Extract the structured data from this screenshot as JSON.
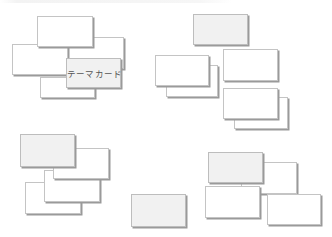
{
  "diagram": {
    "title": "",
    "colors": {
      "card_fill": "#ffffff",
      "card_fill_highlight": "#f1f1f1",
      "card_border": "#c4c4c4",
      "card_shadow": "#9a9a9a",
      "label_text": "#555555"
    },
    "clusters": [
      {
        "name": "top-left",
        "cards": [
          {
            "x": 40,
            "y": 77,
            "w": 55,
            "h": 21,
            "fill": "white",
            "label": ""
          },
          {
            "x": 68,
            "y": 37,
            "w": 56,
            "h": 32,
            "fill": "white",
            "label": ""
          },
          {
            "x": 12,
            "y": 44,
            "w": 56,
            "h": 31,
            "fill": "white",
            "label": ""
          },
          {
            "x": 37,
            "y": 16,
            "w": 56,
            "h": 31,
            "fill": "white",
            "label": ""
          },
          {
            "x": 66,
            "y": 58,
            "w": 55,
            "h": 30,
            "fill": "grey",
            "label": "テーマカード"
          }
        ]
      },
      {
        "name": "top-right",
        "cards": [
          {
            "x": 193,
            "y": 14,
            "w": 55,
            "h": 31,
            "fill": "grey",
            "label": ""
          },
          {
            "x": 166,
            "y": 65,
            "w": 52,
            "h": 32,
            "fill": "white",
            "label": ""
          },
          {
            "x": 155,
            "y": 55,
            "w": 54,
            "h": 31,
            "fill": "white",
            "label": ""
          },
          {
            "x": 223,
            "y": 49,
            "w": 55,
            "h": 32,
            "fill": "white",
            "label": ""
          },
          {
            "x": 234,
            "y": 97,
            "w": 54,
            "h": 32,
            "fill": "white",
            "label": ""
          },
          {
            "x": 223,
            "y": 88,
            "w": 55,
            "h": 31,
            "fill": "white",
            "label": ""
          }
        ]
      },
      {
        "name": "bottom-left",
        "cards": [
          {
            "x": 25,
            "y": 182,
            "w": 56,
            "h": 32,
            "fill": "white",
            "label": ""
          },
          {
            "x": 44,
            "y": 170,
            "w": 56,
            "h": 32,
            "fill": "white",
            "label": ""
          },
          {
            "x": 53,
            "y": 148,
            "w": 56,
            "h": 31,
            "fill": "white",
            "label": ""
          },
          {
            "x": 20,
            "y": 134,
            "w": 55,
            "h": 33,
            "fill": "grey",
            "label": ""
          }
        ]
      },
      {
        "name": "bottom-center",
        "cards": [
          {
            "x": 131,
            "y": 194,
            "w": 55,
            "h": 33,
            "fill": "grey",
            "label": ""
          }
        ]
      },
      {
        "name": "bottom-right",
        "cards": [
          {
            "x": 241,
            "y": 162,
            "w": 56,
            "h": 32,
            "fill": "white",
            "label": ""
          },
          {
            "x": 205,
            "y": 186,
            "w": 55,
            "h": 32,
            "fill": "white",
            "label": ""
          },
          {
            "x": 208,
            "y": 152,
            "w": 55,
            "h": 31,
            "fill": "grey",
            "label": ""
          },
          {
            "x": 267,
            "y": 194,
            "w": 54,
            "h": 31,
            "fill": "white",
            "label": ""
          }
        ]
      }
    ]
  }
}
